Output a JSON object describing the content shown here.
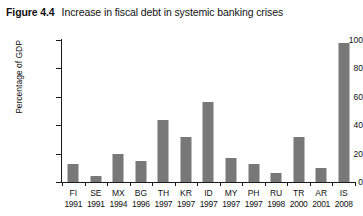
{
  "figure": {
    "number_label": "Figure 4.4",
    "caption": "Increase in fiscal debt in systemic banking crises"
  },
  "chart_data": {
    "type": "bar",
    "title": "Increase in fiscal debt in systemic banking crises",
    "xlabel": "",
    "ylabel": "Percentage of GDP",
    "ylim": [
      0,
      100
    ],
    "yticks": [
      0,
      20,
      40,
      60,
      80,
      100
    ],
    "ytick_labels": [
      "0",
      "20",
      "40",
      "60",
      "80",
      "100"
    ],
    "grid": false,
    "legend": null,
    "bar_color": "#787878",
    "axis_color": "#1a1a1a",
    "categories": [
      "FI 1991",
      "SE 1991",
      "MX 1994",
      "BG 1996",
      "TH 1997",
      "KR 1997",
      "ID 1997",
      "MY 1997",
      "PH 1997",
      "RU 1998",
      "TR 2000",
      "AR 2001",
      "IS 2008"
    ],
    "country_codes": [
      "FI",
      "SE",
      "MX",
      "BG",
      "TH",
      "KR",
      "ID",
      "MY",
      "PH",
      "RU",
      "TR",
      "AR",
      "IS"
    ],
    "years": [
      "1991",
      "1991",
      "1994",
      "1996",
      "1997",
      "1997",
      "1997",
      "1997",
      "1997",
      "1998",
      "2000",
      "2001",
      "2008"
    ],
    "values": [
      13,
      4,
      20,
      15,
      44,
      32,
      56,
      17,
      13,
      6,
      32,
      10,
      98
    ]
  }
}
